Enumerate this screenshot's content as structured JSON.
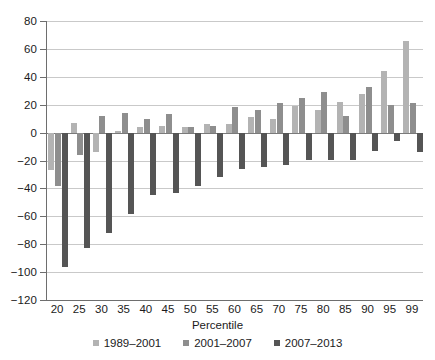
{
  "chart_data": {
    "type": "bar",
    "title": "",
    "xlabel": "Percentile",
    "ylabel": "",
    "ylim": [
      -120,
      80
    ],
    "ytick_step": 20,
    "yticks": [
      80,
      60,
      40,
      20,
      0,
      -20,
      -40,
      -60,
      -80,
      -100,
      -120
    ],
    "ytick_labels": [
      "80",
      "60",
      "40",
      "20",
      "0",
      "−20",
      "−40",
      "−60",
      "−80",
      "−100",
      "−120"
    ],
    "grid": true,
    "grid_axis": "y",
    "legend_position": "bottom",
    "categories": [
      "20",
      "25",
      "30",
      "35",
      "40",
      "45",
      "50",
      "55",
      "60",
      "65",
      "70",
      "75",
      "80",
      "85",
      "90",
      "95",
      "99"
    ],
    "series": [
      {
        "name": "1989–2001",
        "color": "#b3b3b3",
        "values": [
          -27,
          7,
          -14,
          1,
          4,
          5,
          4,
          6,
          6,
          11,
          10,
          19,
          16,
          22,
          28,
          44,
          66
        ]
      },
      {
        "name": "2001–2007",
        "color": "#8e8e8e",
        "values": [
          -38,
          -16,
          12,
          14,
          10,
          13,
          4,
          5,
          18,
          16,
          21,
          25,
          29,
          12,
          33,
          20,
          21
        ]
      },
      {
        "name": "2007–2013",
        "color": "#555555",
        "values": [
          -96,
          -83,
          -72,
          -58,
          -45,
          -43,
          -38,
          -32,
          -26,
          -25,
          -23,
          -20,
          -20,
          -20,
          -13,
          -6,
          -14
        ]
      }
    ]
  },
  "legend": {
    "items": [
      {
        "label": "1989–2001"
      },
      {
        "label": "2001–2007"
      },
      {
        "label": "2007–2013"
      }
    ]
  }
}
